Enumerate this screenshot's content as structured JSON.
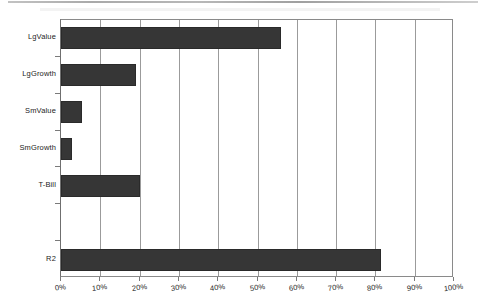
{
  "chart_data": {
    "type": "bar",
    "orientation": "horizontal",
    "title": "",
    "subtitle": "",
    "xlabel": "",
    "ylabel": "",
    "categories": [
      "LgValue",
      "LgGrowth",
      "SmValue",
      "SmGrowth",
      "T-Bill",
      "",
      "R2"
    ],
    "values": [
      56.0,
      19.0,
      5.3,
      2.7,
      20.0,
      null,
      81.5
    ],
    "series": [
      {
        "name": "",
        "values": [
          56.0,
          19.0,
          5.3,
          2.7,
          20.0,
          null,
          81.5
        ]
      }
    ],
    "xlim": [
      0,
      100
    ],
    "xticks": [
      0,
      10,
      20,
      30,
      40,
      50,
      60,
      70,
      80,
      90,
      100
    ],
    "xtick_labels": [
      "0%",
      "10%",
      "20%",
      "30%",
      "40%",
      "50%",
      "60%",
      "70%",
      "80%",
      "90%",
      "100%"
    ],
    "value_format": "percent",
    "grid": true,
    "grid_axis": "x",
    "legend": false,
    "legend_position": "none",
    "bar_color": "#363636",
    "grid_color": "#9b9b9b",
    "axis_color": "#7a7a7a",
    "background_color": "#ffffff"
  },
  "plot": {
    "left_px": 60,
    "top_px": 19,
    "width_px": 393,
    "height_px": 258,
    "slot_count": 7
  }
}
